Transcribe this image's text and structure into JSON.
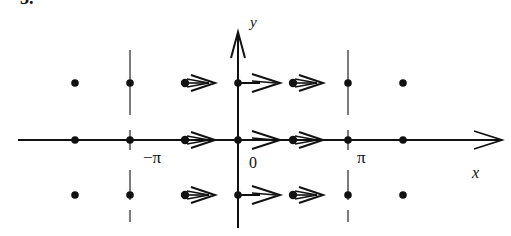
{
  "figure": {
    "corner_label": "3.",
    "axes": {
      "x_label": "x",
      "y_label": "y",
      "color": "#111111"
    },
    "tick_labels": {
      "neg_pi": "−π",
      "zero": "0",
      "pi": "π"
    },
    "grid": {
      "columns_x": [
        -2,
        -1,
        -0.5,
        0,
        0.5,
        1,
        1.5
      ],
      "rows_y": [
        1,
        0,
        -1
      ],
      "dashed_lines_at": [
        "-π",
        "π"
      ]
    },
    "vector_field": {
      "description": "Rightward arrows on the points strictly between -π and π; equilibrium points elsewhere",
      "arrow_rows": [
        "top",
        "middle",
        "bottom"
      ],
      "arrow_positions": [
        "left-of-origin",
        "at-origin",
        "right-of-origin"
      ]
    }
  }
}
